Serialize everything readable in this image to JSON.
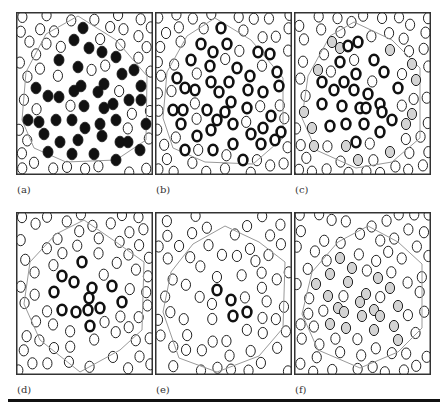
{
  "figure": {
    "panels": [
      {
        "id": "a",
        "label": "(a)",
        "x": 16,
        "y": 12,
        "inner_style": "filled",
        "gray_style": "none",
        "polygon": [
          [
            62,
            4
          ],
          [
            100,
            28
          ],
          [
            131,
            64
          ],
          [
            130,
            128
          ],
          [
            100,
            148
          ],
          [
            50,
            150
          ],
          [
            18,
            136
          ],
          [
            6,
            108
          ],
          [
            10,
            60
          ],
          [
            30,
            22
          ]
        ],
        "inner": [
          [
            67,
            16
          ],
          [
            58,
            28
          ],
          [
            73,
            36
          ],
          [
            86,
            40
          ],
          [
            43,
            48
          ],
          [
            62,
            55
          ],
          [
            100,
            45
          ],
          [
            106,
            62
          ],
          [
            118,
            58
          ],
          [
            65,
            74
          ],
          [
            88,
            72
          ],
          [
            20,
            76
          ],
          [
            32,
            84
          ],
          [
            43,
            85
          ],
          [
            58,
            79
          ],
          [
            82,
            80
          ],
          [
            97,
            92
          ],
          [
            125,
            74
          ],
          [
            125,
            88
          ],
          [
            68,
            94
          ],
          [
            88,
            96
          ],
          [
            100,
            108
          ],
          [
            113,
            88
          ],
          [
            40,
            108
          ],
          [
            12,
            108
          ],
          [
            23,
            110
          ],
          [
            56,
            108
          ],
          [
            69,
            116
          ],
          [
            84,
            112
          ],
          [
            130,
            112
          ],
          [
            28,
            122
          ],
          [
            44,
            130
          ],
          [
            62,
            128
          ],
          [
            86,
            124
          ],
          [
            104,
            130
          ],
          [
            112,
            130
          ],
          [
            124,
            138
          ],
          [
            32,
            140
          ],
          [
            56,
            142
          ],
          [
            78,
            142
          ],
          [
            100,
            148
          ]
        ]
      },
      {
        "id": "b",
        "label": "(b)",
        "x": 155,
        "y": 12,
        "inner_style": "thick",
        "gray_style": "none",
        "polygon": [
          [
            60,
            6
          ],
          [
            96,
            28
          ],
          [
            128,
            66
          ],
          [
            128,
            126
          ],
          [
            98,
            152
          ],
          [
            50,
            150
          ],
          [
            18,
            136
          ],
          [
            8,
            106
          ],
          [
            12,
            60
          ],
          [
            32,
            24
          ]
        ],
        "inner": [
          [
            66,
            16
          ],
          [
            46,
            32
          ],
          [
            72,
            32
          ],
          [
            58,
            40
          ],
          [
            103,
            40
          ],
          [
            115,
            42
          ],
          [
            36,
            48
          ],
          [
            55,
            54
          ],
          [
            82,
            56
          ],
          [
            122,
            60
          ],
          [
            22,
            66
          ],
          [
            56,
            70
          ],
          [
            74,
            70
          ],
          [
            95,
            64
          ],
          [
            30,
            76
          ],
          [
            40,
            78
          ],
          [
            64,
            80
          ],
          [
            93,
            78
          ],
          [
            108,
            80
          ],
          [
            124,
            74
          ],
          [
            76,
            90
          ],
          [
            18,
            98
          ],
          [
            28,
            98
          ],
          [
            52,
            98
          ],
          [
            70,
            100
          ],
          [
            92,
            96
          ],
          [
            116,
            104
          ],
          [
            26,
            112
          ],
          [
            62,
            108
          ],
          [
            78,
            112
          ],
          [
            108,
            116
          ],
          [
            42,
            124
          ],
          [
            56,
            118
          ],
          [
            96,
            122
          ],
          [
            126,
            120
          ],
          [
            120,
            128
          ],
          [
            30,
            138
          ],
          [
            58,
            138
          ],
          [
            78,
            132
          ],
          [
            106,
            132
          ],
          [
            88,
            148
          ]
        ]
      },
      {
        "id": "c",
        "label": "(c)",
        "x": 294,
        "y": 12,
        "inner_style": "thick",
        "gray_style": "gray",
        "polygon": [
          [
            60,
            10
          ],
          [
            98,
            28
          ],
          [
            126,
            56
          ],
          [
            126,
            126
          ],
          [
            98,
            150
          ],
          [
            62,
            156
          ],
          [
            22,
            138
          ],
          [
            8,
            106
          ],
          [
            14,
            64
          ],
          [
            36,
            24
          ]
        ],
        "inner": [
          [
            64,
            30
          ],
          [
            54,
            34
          ],
          [
            46,
            50
          ],
          [
            80,
            48
          ],
          [
            62,
            62
          ],
          [
            90,
            60
          ],
          [
            28,
            70
          ],
          [
            50,
            70
          ],
          [
            40,
            78
          ],
          [
            60,
            78
          ],
          [
            74,
            82
          ],
          [
            104,
            76
          ],
          [
            66,
            96
          ],
          [
            86,
            92
          ],
          [
            28,
            92
          ],
          [
            48,
            94
          ],
          [
            72,
            96
          ],
          [
            88,
            100
          ],
          [
            98,
            108
          ],
          [
            36,
            114
          ],
          [
            52,
            112
          ],
          [
            70,
            112
          ],
          [
            86,
            120
          ],
          [
            62,
            130
          ]
        ],
        "gray": [
          [
            38,
            30
          ],
          [
            46,
            36
          ],
          [
            96,
            38
          ],
          [
            24,
            58
          ],
          [
            118,
            52
          ],
          [
            122,
            68
          ],
          [
            10,
            100
          ],
          [
            118,
            102
          ],
          [
            18,
            116
          ],
          [
            112,
            112
          ],
          [
            20,
            134
          ],
          [
            52,
            134
          ],
          [
            96,
            140
          ],
          [
            64,
            148
          ]
        ]
      },
      {
        "id": "d",
        "label": "(d)",
        "x": 16,
        "y": 212,
        "inner_style": "thick",
        "gray_style": "none",
        "polygon": [
          [
            68,
            8
          ],
          [
            100,
            30
          ],
          [
            128,
            50
          ],
          [
            126,
            118
          ],
          [
            104,
            138
          ],
          [
            64,
            160
          ],
          [
            24,
            128
          ],
          [
            8,
            92
          ],
          [
            14,
            50
          ],
          [
            40,
            22
          ]
        ],
        "inner": [
          [
            66,
            50
          ],
          [
            46,
            64
          ],
          [
            58,
            70
          ],
          [
            76,
            76
          ],
          [
            38,
            80
          ],
          [
            96,
            74
          ],
          [
            73,
            86
          ],
          [
            84,
            96
          ],
          [
            106,
            90
          ],
          [
            46,
            98
          ],
          [
            60,
            100
          ],
          [
            72,
            98
          ],
          [
            74,
            114
          ]
        ]
      },
      {
        "id": "e",
        "label": "(e)",
        "x": 155,
        "y": 212,
        "inner_style": "thick",
        "gray_style": "none",
        "polygon": [
          [
            70,
            14
          ],
          [
            104,
            30
          ],
          [
            130,
            50
          ],
          [
            128,
            116
          ],
          [
            104,
            144
          ],
          [
            62,
            160
          ],
          [
            24,
            146
          ],
          [
            8,
            100
          ],
          [
            16,
            60
          ],
          [
            38,
            32
          ]
        ],
        "inner": [
          [
            62,
            78
          ],
          [
            76,
            88
          ],
          [
            78,
            104
          ],
          [
            92,
            100
          ]
        ]
      },
      {
        "id": "f",
        "label": "(f)",
        "x": 294,
        "y": 212,
        "inner_style": "none",
        "gray_style": "gray",
        "polygon": [
          [
            74,
            14
          ],
          [
            104,
            30
          ],
          [
            128,
            52
          ],
          [
            128,
            116
          ],
          [
            104,
            140
          ],
          [
            66,
            156
          ],
          [
            24,
            138
          ],
          [
            8,
            102
          ],
          [
            18,
            60
          ],
          [
            44,
            30
          ]
        ],
        "inner": [],
        "gray": [
          [
            46,
            46
          ],
          [
            58,
            56
          ],
          [
            36,
            62
          ],
          [
            54,
            70
          ],
          [
            84,
            66
          ],
          [
            22,
            72
          ],
          [
            72,
            82
          ],
          [
            96,
            76
          ],
          [
            66,
            90
          ],
          [
            34,
            84
          ],
          [
            44,
            96
          ],
          [
            80,
            98
          ],
          [
            104,
            94
          ],
          [
            50,
            100
          ],
          [
            68,
            104
          ],
          [
            86,
            104
          ],
          [
            100,
            114
          ],
          [
            36,
            112
          ],
          [
            52,
            116
          ],
          [
            80,
            118
          ],
          [
            104,
            128
          ]
        ]
      }
    ],
    "outer_circles_note": "thin open rings scattered everywhere outside highlighted sets",
    "bottom_rule": true,
    "colors": {
      "border": "#333333",
      "polygon": "#999999",
      "ring": "#111111",
      "gray_fill": "#d4d4d4"
    }
  }
}
